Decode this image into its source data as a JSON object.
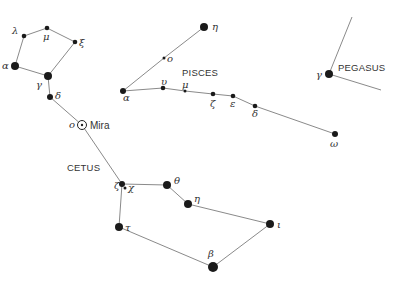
{
  "constellations": [
    {
      "id": "cetus",
      "label": "CETUS"
    },
    {
      "id": "pisces",
      "label": "PISCES"
    },
    {
      "id": "pegasus",
      "label": "PEGASUS"
    }
  ],
  "stars": [
    {
      "id": "cet-lambda",
      "greek": "λ",
      "constellation": "cetus",
      "magnitude_class": "small"
    },
    {
      "id": "cet-mu",
      "greek": "μ",
      "constellation": "cetus",
      "magnitude_class": "small"
    },
    {
      "id": "cet-xi",
      "greek": "ξ",
      "constellation": "cetus",
      "magnitude_class": "small"
    },
    {
      "id": "cet-alpha",
      "greek": "α",
      "constellation": "cetus",
      "magnitude_class": "large"
    },
    {
      "id": "cet-gamma",
      "greek": "γ",
      "constellation": "cetus",
      "magnitude_class": "large"
    },
    {
      "id": "cet-delta",
      "greek": "δ",
      "constellation": "cetus",
      "magnitude_class": "medium"
    },
    {
      "id": "cet-omicron",
      "greek": "ο",
      "name": "Mira",
      "constellation": "cetus",
      "magnitude_class": "variable"
    },
    {
      "id": "cet-zeta",
      "greek": "ζ",
      "constellation": "cetus",
      "magnitude_class": "medium"
    },
    {
      "id": "cet-chi",
      "greek": "χ",
      "constellation": "cetus",
      "magnitude_class": "tiny"
    },
    {
      "id": "cet-theta",
      "greek": "θ",
      "constellation": "cetus",
      "magnitude_class": "large"
    },
    {
      "id": "cet-eta",
      "greek": "η",
      "constellation": "cetus",
      "magnitude_class": "large"
    },
    {
      "id": "cet-tau",
      "greek": "τ",
      "constellation": "cetus",
      "magnitude_class": "large"
    },
    {
      "id": "cet-beta",
      "greek": "β",
      "constellation": "cetus",
      "magnitude_class": "xlarge"
    },
    {
      "id": "cet-iota",
      "greek": "ι",
      "constellation": "cetus",
      "magnitude_class": "large"
    },
    {
      "id": "psc-eta",
      "greek": "η",
      "constellation": "pisces",
      "magnitude_class": "large"
    },
    {
      "id": "psc-omicron",
      "greek": "ο",
      "constellation": "pisces",
      "magnitude_class": "tiny"
    },
    {
      "id": "psc-alpha",
      "greek": "α",
      "constellation": "pisces",
      "magnitude_class": "medium"
    },
    {
      "id": "psc-upsilon",
      "greek": "υ",
      "constellation": "pisces",
      "magnitude_class": "small"
    },
    {
      "id": "psc-mu",
      "greek": "μ",
      "constellation": "pisces",
      "magnitude_class": "tiny"
    },
    {
      "id": "psc-zeta",
      "greek": "ζ",
      "constellation": "pisces",
      "magnitude_class": "small"
    },
    {
      "id": "psc-epsilon",
      "greek": "ε",
      "constellation": "pisces",
      "magnitude_class": "small"
    },
    {
      "id": "psc-delta",
      "greek": "δ",
      "constellation": "pisces",
      "magnitude_class": "small"
    },
    {
      "id": "psc-omega",
      "greek": "ω",
      "constellation": "pisces",
      "magnitude_class": "medium"
    },
    {
      "id": "peg-gamma",
      "greek": "γ",
      "constellation": "pegasus",
      "magnitude_class": "large"
    }
  ],
  "links": [
    [
      "cet-alpha",
      "cet-lambda"
    ],
    [
      "cet-lambda",
      "cet-mu"
    ],
    [
      "cet-mu",
      "cet-xi"
    ],
    [
      "cet-xi",
      "cet-gamma"
    ],
    [
      "cet-gamma",
      "cet-alpha"
    ],
    [
      "cet-gamma",
      "cet-delta"
    ],
    [
      "cet-delta",
      "cet-omicron"
    ],
    [
      "cet-omicron",
      "cet-zeta"
    ],
    [
      "cet-zeta",
      "cet-theta"
    ],
    [
      "cet-theta",
      "cet-eta"
    ],
    [
      "cet-eta",
      "cet-iota"
    ],
    [
      "cet-iota",
      "cet-beta"
    ],
    [
      "cet-beta",
      "cet-tau"
    ],
    [
      "cet-tau",
      "cet-zeta"
    ],
    [
      "psc-alpha",
      "psc-omicron"
    ],
    [
      "psc-omicron",
      "psc-eta"
    ],
    [
      "psc-alpha",
      "psc-upsilon"
    ],
    [
      "psc-upsilon",
      "psc-mu"
    ],
    [
      "psc-mu",
      "psc-zeta"
    ],
    [
      "psc-zeta",
      "psc-epsilon"
    ],
    [
      "psc-epsilon",
      "psc-delta"
    ],
    [
      "psc-delta",
      "psc-omega"
    ]
  ]
}
